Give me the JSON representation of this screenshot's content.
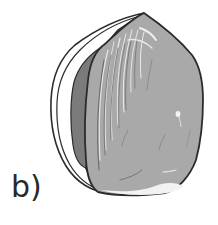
{
  "figure": {
    "panel_label": "b)",
    "colors": {
      "outline": "#2b2b2b",
      "kernel_fill": "#a9a9a9",
      "shell_fill": "#ffffff",
      "inner_dark": "#7b7b7b",
      "highlight": "#ececec"
    }
  }
}
